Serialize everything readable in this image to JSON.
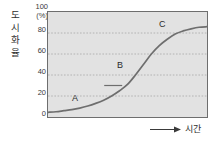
{
  "chart_data": {
    "type": "line",
    "title": "",
    "subtitle": "",
    "ylabel": "도시화율",
    "yunit": "(%)",
    "yunit_top_value": "100",
    "xlabel": "시간",
    "grid": true,
    "legend_position": "none",
    "ylim": [
      0,
      100
    ],
    "yticks": [
      "0",
      "20",
      "40",
      "60",
      "80",
      "100"
    ],
    "xticks": [],
    "series": [
      {
        "name": "도시화율",
        "color": "#6b6b6b",
        "x": [
          0,
          5,
          10,
          15,
          20,
          25,
          30,
          35,
          40,
          45,
          50,
          55,
          60,
          65,
          70,
          75,
          80,
          85,
          90,
          95,
          100
        ],
        "values": [
          4.5,
          5,
          6,
          7,
          8.5,
          10.5,
          13,
          16,
          20,
          25,
          31,
          40,
          50,
          60,
          68,
          74,
          79,
          82,
          84,
          85.5,
          86
        ]
      }
    ],
    "annotations": [
      {
        "label": "A",
        "stage": "초기 단계",
        "x": 24,
        "y": 19
      },
      {
        "label": "B",
        "stage": "가속화 단계",
        "x": 52,
        "y": 55
      },
      {
        "label": "C",
        "stage": "종착 단계",
        "x": 80,
        "y": 87
      }
    ],
    "markers": [
      {
        "name": "inflection-tick",
        "x": 41,
        "y": 30
      }
    ]
  }
}
